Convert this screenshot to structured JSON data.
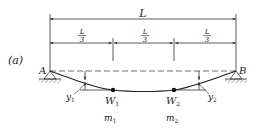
{
  "figure": {
    "panel_label": "(a)",
    "span_label": "L",
    "segment_labels": [
      {
        "num": "L",
        "den": "3"
      },
      {
        "num": "L",
        "den": "3"
      },
      {
        "num": "L",
        "den": "3"
      }
    ],
    "support_left": "A",
    "support_right": "B",
    "deflection_left": {
      "symbol": "y",
      "sub": "1"
    },
    "deflection_right": {
      "symbol": "y",
      "sub": "2"
    },
    "loads": [
      {
        "weight": "W",
        "weight_sub": "1",
        "mass": "m",
        "mass_sub": "1"
      },
      {
        "weight": "W",
        "weight_sub": "2",
        "mass": "m",
        "mass_sub": "2"
      }
    ]
  }
}
